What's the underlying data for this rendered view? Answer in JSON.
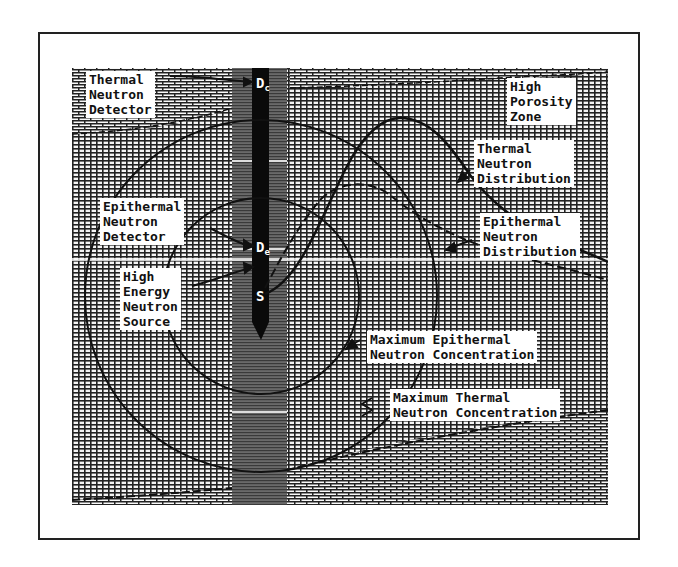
{
  "diagram": {
    "type": "neutron-logging-tool-schematic",
    "labels": {
      "thermal_detector": "Thermal\nNeutron\nDetector",
      "high_porosity_zone": "High\nPorosity\nZone",
      "thermal_distribution": "Thermal\nNeutron\nDistribution",
      "epithermal_detector": "Epithermal\nNeutron\nDetector",
      "epithermal_distribution": "Epithermal\nNeutron\nDistribution",
      "source": "High\nEnergy\nNeutron\nSource",
      "max_epithermal": "Maximum Epithermal\nNeutron Concentration",
      "max_thermal": "Maximum Thermal\nNeutron Concentration"
    },
    "markers": {
      "thermal_detector": {
        "letter": "D",
        "sub": "c"
      },
      "epithermal_detector": {
        "letter": "D",
        "sub": "e"
      },
      "source": {
        "letter": "S"
      }
    },
    "zones": [
      "Upper Dense Formation (brick pattern)",
      "High Porosity Zone (grid pattern)",
      "Lower Dense Formation (brick pattern)",
      "Borehole"
    ],
    "colors": {
      "ink": "#111111",
      "paper": "#ffffff",
      "borehole": "#555555",
      "tool": "#0a0a0a"
    }
  }
}
